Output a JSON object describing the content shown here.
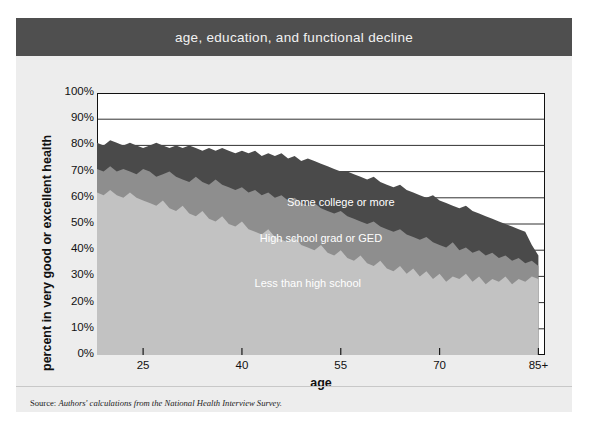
{
  "figure": {
    "title": "age, education, and functional decline",
    "title_bar_color": "#4f4f4f",
    "background_color": "#ededed",
    "source_prefix": "Source: ",
    "source_text": "Authors' calculations from the National Health Interview Survey."
  },
  "chart_data": {
    "type": "area",
    "title": "age, education, and functional decline",
    "xlabel": "age",
    "ylabel": "percent in very good or excellent health",
    "xlim": [
      18,
      86
    ],
    "ylim": [
      0,
      100
    ],
    "grid": true,
    "legend_position": "inline-annotations",
    "stacked": false,
    "overlapping": true,
    "ytick_labels": [
      "100%",
      "90%",
      "80%",
      "70%",
      "60%",
      "50%",
      "40%",
      "30%",
      "20%",
      "10%",
      "0%"
    ],
    "ytick_values": [
      100,
      90,
      80,
      70,
      60,
      50,
      40,
      30,
      20,
      10,
      0
    ],
    "xtick_labels": [
      "25",
      "40",
      "55",
      "70",
      "85+"
    ],
    "xtick_values": [
      25,
      40,
      55,
      70,
      85
    ],
    "x": [
      18,
      19,
      20,
      21,
      22,
      23,
      24,
      25,
      26,
      27,
      28,
      29,
      30,
      31,
      32,
      33,
      34,
      35,
      36,
      37,
      38,
      39,
      40,
      41,
      42,
      43,
      44,
      45,
      46,
      47,
      48,
      49,
      50,
      51,
      52,
      53,
      54,
      55,
      56,
      57,
      58,
      59,
      60,
      61,
      62,
      63,
      64,
      65,
      66,
      67,
      68,
      69,
      70,
      71,
      72,
      73,
      74,
      75,
      76,
      77,
      78,
      79,
      80,
      81,
      82,
      83,
      84,
      85
    ],
    "series": [
      {
        "name": "Some college or more",
        "color": "#4a4a4a",
        "label_x": 55,
        "label_y": 57,
        "values": [
          81,
          80,
          82,
          81,
          80,
          81,
          80,
          79,
          80,
          81,
          80,
          79,
          80,
          79,
          80,
          79,
          78,
          79,
          78,
          79,
          78,
          77,
          78,
          77,
          78,
          76,
          77,
          76,
          77,
          75,
          76,
          74,
          75,
          74,
          73,
          72,
          71,
          70,
          70,
          69,
          68,
          67,
          68,
          66,
          65,
          64,
          65,
          63,
          62,
          61,
          60,
          61,
          59,
          58,
          57,
          56,
          57,
          55,
          54,
          53,
          52,
          51,
          50,
          49,
          48,
          47,
          42,
          38
        ]
      },
      {
        "name": "High school grad or GED",
        "color": "#8e8e8e",
        "label_x": 52,
        "label_y": 43,
        "values": [
          71,
          70,
          72,
          70,
          71,
          70,
          69,
          71,
          70,
          68,
          69,
          70,
          68,
          67,
          66,
          68,
          66,
          65,
          67,
          65,
          64,
          63,
          64,
          62,
          63,
          61,
          62,
          60,
          61,
          59,
          60,
          58,
          57,
          58,
          56,
          55,
          54,
          55,
          53,
          52,
          51,
          50,
          51,
          49,
          48,
          47,
          48,
          46,
          45,
          44,
          45,
          43,
          42,
          41,
          43,
          40,
          41,
          39,
          40,
          38,
          39,
          37,
          38,
          36,
          37,
          35,
          36,
          34
        ]
      },
      {
        "name": "Less than high school",
        "color": "#c2c2c2",
        "label_x": 50,
        "label_y": 26,
        "values": [
          62,
          61,
          63,
          61,
          60,
          62,
          60,
          59,
          58,
          57,
          59,
          56,
          55,
          57,
          54,
          53,
          55,
          52,
          51,
          53,
          50,
          49,
          51,
          48,
          47,
          46,
          48,
          45,
          44,
          43,
          45,
          42,
          41,
          40,
          42,
          39,
          38,
          40,
          37,
          36,
          38,
          35,
          34,
          36,
          33,
          32,
          34,
          31,
          33,
          30,
          32,
          29,
          31,
          28,
          30,
          29,
          31,
          28,
          30,
          27,
          29,
          28,
          30,
          27,
          29,
          28,
          30,
          29
        ]
      }
    ]
  }
}
